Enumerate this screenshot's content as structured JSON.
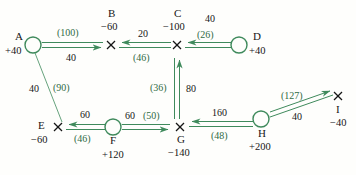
{
  "diagram": {
    "colors": {
      "edge": "#3f8a5c",
      "cost_text": "#2f6b45",
      "flow_text": "#161616",
      "node_circle": "#3f8a5c",
      "node_cross": "#161616"
    },
    "nodes": [
      {
        "id": "A",
        "label": "A",
        "supply": "+40",
        "marker": "circle",
        "x": 33,
        "y": 45
      },
      {
        "id": "B",
        "label": "B",
        "supply": "−60",
        "marker": "cross",
        "x": 111,
        "y": 45
      },
      {
        "id": "C",
        "label": "C",
        "supply": "−100",
        "marker": "cross",
        "x": 177,
        "y": 45
      },
      {
        "id": "D",
        "label": "D",
        "supply": "+40",
        "marker": "circle",
        "x": 239,
        "y": 45
      },
      {
        "id": "E",
        "label": "E",
        "supply": "−60",
        "marker": "cross",
        "x": 58,
        "y": 127
      },
      {
        "id": "F",
        "label": "F",
        "supply": "+120",
        "marker": "circle",
        "x": 113,
        "y": 127
      },
      {
        "id": "G",
        "label": "G",
        "supply": "−140",
        "marker": "cross",
        "x": 180,
        "y": 127
      },
      {
        "id": "H",
        "label": "H",
        "supply": "+200",
        "marker": "circle",
        "x": 261,
        "y": 119
      },
      {
        "id": "I",
        "label": "I",
        "supply": "−40",
        "marker": "cross",
        "x": 338,
        "y": 96
      }
    ],
    "edges": [
      {
        "id": "A-B",
        "from": "A",
        "to": "B",
        "cost": "(100)",
        "flow": "40",
        "style": "double",
        "arrow": "to"
      },
      {
        "id": "C-B",
        "from": "C",
        "to": "B",
        "cost": "(46)",
        "flow": "20",
        "style": "double",
        "arrow": "to"
      },
      {
        "id": "D-C",
        "from": "D",
        "to": "C",
        "cost": "(26)",
        "flow": "40",
        "style": "double",
        "arrow": "to"
      },
      {
        "id": "A-E",
        "from": "A",
        "to": "E",
        "cost": "(90)",
        "flow": "40",
        "style": "single",
        "arrow": "none"
      },
      {
        "id": "F-E",
        "from": "F",
        "to": "E",
        "cost": "(46)",
        "flow": "60",
        "style": "double",
        "arrow": "to"
      },
      {
        "id": "F-G",
        "from": "F",
        "to": "G",
        "cost": "(50)",
        "flow": "60",
        "style": "double",
        "arrow": "to"
      },
      {
        "id": "G-C",
        "from": "G",
        "to": "C",
        "cost": "(36)",
        "flow": "80",
        "style": "double",
        "arrow": "to"
      },
      {
        "id": "H-G",
        "from": "H",
        "to": "G",
        "cost": "(48)",
        "flow": "160",
        "style": "double",
        "arrow": "to"
      },
      {
        "id": "H-I",
        "from": "H",
        "to": "I",
        "cost": "(127)",
        "flow": "40",
        "style": "double",
        "arrow": "to"
      }
    ]
  }
}
